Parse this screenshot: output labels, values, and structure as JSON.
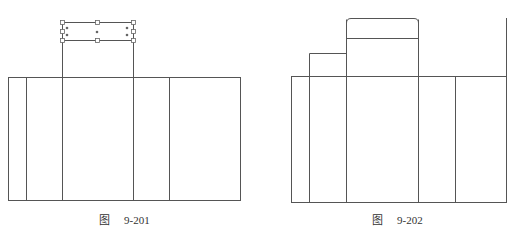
{
  "figures": [
    {
      "fig_char": "图",
      "number": "9-201"
    },
    {
      "fig_char": "图",
      "number": "9-202"
    }
  ],
  "colors": {
    "line": "#555555",
    "handle": "#666666"
  }
}
